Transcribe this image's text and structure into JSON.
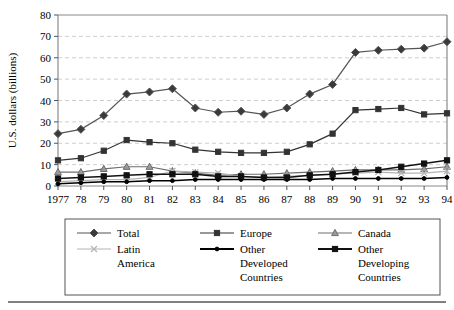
{
  "chart_data": {
    "type": "line",
    "title": "",
    "xlabel": "",
    "ylabel": "U.S. dollars (billions)",
    "ylim": [
      0,
      80
    ],
    "yticks": [
      0,
      10,
      20,
      30,
      40,
      50,
      60,
      70,
      80
    ],
    "grid": true,
    "legend_position": "bottom",
    "categories": [
      "1977",
      "78",
      "79",
      "80",
      "81",
      "82",
      "83",
      "84",
      "85",
      "86",
      "87",
      "88",
      "89",
      "90",
      "91",
      "92",
      "93",
      "94"
    ],
    "series": [
      {
        "name": "Total",
        "color": "#555555",
        "marker": "diamond",
        "values": [
          24.5,
          26.5,
          33.0,
          43.0,
          44.0,
          45.5,
          36.5,
          34.5,
          35.0,
          33.5,
          36.5,
          43.0,
          47.5,
          62.5,
          63.5,
          64.0,
          64.5,
          67.5
        ]
      },
      {
        "name": "Europe",
        "color": "#333333",
        "marker": "square",
        "values": [
          12.0,
          13.0,
          16.5,
          21.5,
          20.5,
          20.0,
          17.0,
          16.0,
          15.5,
          15.5,
          16.0,
          19.5,
          24.5,
          35.5,
          36.0,
          36.5,
          33.5,
          34.0
        ]
      },
      {
        "name": "Canada",
        "color": "#6e6e6e",
        "marker": "triangle",
        "values": [
          6.5,
          6.5,
          8.0,
          9.0,
          9.0,
          7.0,
          6.0,
          5.0,
          5.5,
          5.5,
          6.0,
          6.5,
          7.0,
          7.5,
          7.5,
          7.5,
          8.0,
          9.0
        ]
      },
      {
        "name": "Latin America",
        "color": "#b4b4b4",
        "marker": "x",
        "values": [
          2.0,
          2.5,
          3.0,
          3.0,
          4.0,
          7.0,
          6.5,
          6.0,
          4.5,
          4.0,
          4.5,
          5.0,
          5.5,
          6.0,
          6.5,
          6.0,
          6.0,
          7.0
        ]
      },
      {
        "name": "Other Developed Countries",
        "color": "#000000",
        "marker": "dot",
        "values": [
          1.0,
          1.5,
          2.0,
          2.0,
          2.5,
          2.5,
          3.0,
          3.0,
          3.0,
          3.0,
          3.0,
          3.0,
          3.5,
          3.5,
          3.5,
          3.5,
          3.5,
          4.0
        ]
      },
      {
        "name": "Other Developing Countries",
        "color": "#111111",
        "marker": "square",
        "values": [
          3.5,
          4.0,
          4.5,
          5.0,
          5.5,
          5.5,
          5.5,
          4.5,
          4.5,
          4.0,
          4.0,
          5.0,
          5.5,
          6.5,
          7.5,
          9.0,
          10.5,
          12.0
        ]
      }
    ]
  },
  "legend": {
    "entries": [
      {
        "label": "Total",
        "key": "Total"
      },
      {
        "label": "Europe",
        "key": "Europe"
      },
      {
        "label": "Canada",
        "key": "Canada"
      },
      {
        "label": "Latin America",
        "key": "Latin America"
      },
      {
        "label": "Other Developed Countries",
        "key": "Other Developed Countries"
      },
      {
        "label": "Other Developing Countries",
        "key": "Other Developing Countries"
      }
    ]
  }
}
